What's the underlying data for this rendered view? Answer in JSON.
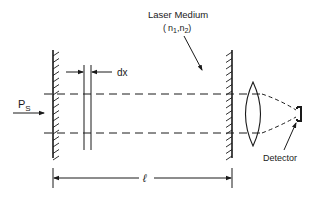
{
  "diagram": {
    "labels": {
      "medium_title": "Laser Medium",
      "medium_params_open": "(",
      "n1": "n",
      "n1_sub": "1",
      "comma": ",",
      "n2": "n",
      "n2_sub": "2",
      "medium_params_close": ")",
      "slab_width": "dx",
      "source_power": "P",
      "source_power_sub": "S",
      "cavity_length": "ℓ",
      "detector": "Detector"
    },
    "components": [
      "input-mirror",
      "slab-dx",
      "output-mirror",
      "lens",
      "detector"
    ],
    "line_color": "#1a1a1a",
    "background": "#ffffff"
  }
}
